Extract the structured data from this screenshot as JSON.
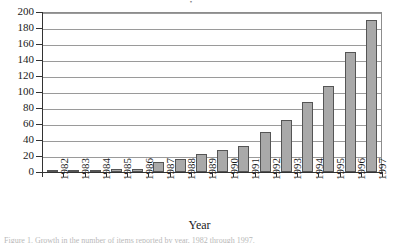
{
  "figure": {
    "title_remnant": "•",
    "caption_remnant": "Figure 1. Growth in the number of items reported by year, 1982 through 1997."
  },
  "axes": {
    "x_axis_title": "Year",
    "y_tick_labels": [
      "200",
      "180",
      "160",
      "140",
      "120",
      "100",
      "80",
      "60",
      "40",
      "20",
      "0"
    ],
    "x_tick_labels": [
      "1982",
      "1983",
      "1984",
      "1985",
      "1986",
      "1987",
      "1988",
      "1989",
      "1990",
      "1991",
      "1992",
      "1993",
      "1994",
      "1995",
      "1996",
      "1997"
    ]
  },
  "style": {
    "bar_fill": "#a9a9a9",
    "bar_stroke": "#555555",
    "grid_color": "#9a9a9a",
    "axis_color": "#333333"
  },
  "chart_data": {
    "type": "bar",
    "title": "",
    "xlabel": "Year",
    "ylabel": "",
    "categories": [
      "1982",
      "1983",
      "1984",
      "1985",
      "1986",
      "1987",
      "1988",
      "1989",
      "1990",
      "1991",
      "1992",
      "1993",
      "1994",
      "1995",
      "1996",
      "1997"
    ],
    "values": [
      1,
      1,
      2,
      4,
      4,
      12,
      16,
      23,
      27,
      33,
      50,
      65,
      87,
      108,
      150,
      190
    ],
    "ylim": [
      0,
      200
    ],
    "ytick_step": 20,
    "grid": true,
    "legend": "none",
    "series": [
      {
        "name": "Count",
        "values": [
          1,
          1,
          2,
          4,
          4,
          12,
          16,
          23,
          27,
          33,
          50,
          65,
          87,
          108,
          150,
          190
        ]
      }
    ]
  }
}
